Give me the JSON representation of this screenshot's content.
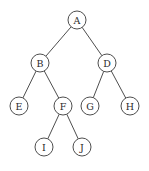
{
  "diagram": {
    "type": "binary-tree",
    "nodes": [
      {
        "id": "A",
        "label": "A",
        "x": 77,
        "y": 20
      },
      {
        "id": "B",
        "label": "B",
        "x": 40,
        "y": 63
      },
      {
        "id": "D",
        "label": "D",
        "x": 107,
        "y": 63
      },
      {
        "id": "E",
        "label": "E",
        "x": 19,
        "y": 106
      },
      {
        "id": "F",
        "label": "F",
        "x": 63,
        "y": 106
      },
      {
        "id": "G",
        "label": "G",
        "x": 90,
        "y": 106
      },
      {
        "id": "H",
        "label": "H",
        "x": 130,
        "y": 106
      },
      {
        "id": "I",
        "label": "I",
        "x": 44,
        "y": 147
      },
      {
        "id": "J",
        "label": "J",
        "x": 82,
        "y": 147
      }
    ],
    "edges": [
      {
        "from": "A",
        "to": "B"
      },
      {
        "from": "A",
        "to": "D"
      },
      {
        "from": "B",
        "to": "E"
      },
      {
        "from": "B",
        "to": "F"
      },
      {
        "from": "D",
        "to": "G"
      },
      {
        "from": "D",
        "to": "H"
      },
      {
        "from": "F",
        "to": "I"
      },
      {
        "from": "F",
        "to": "J"
      }
    ],
    "node_radius": 9
  }
}
